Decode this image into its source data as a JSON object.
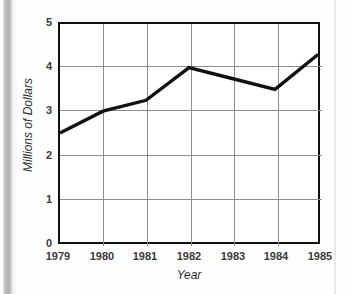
{
  "chart_data": {
    "type": "line",
    "title": "",
    "subtitle": "",
    "xlabel": "Year",
    "ylabel": "Millions of Dollars",
    "categories": [
      "1979",
      "1980",
      "1981",
      "1982",
      "1983",
      "1984",
      "1985"
    ],
    "x": [
      1979,
      1980,
      1981,
      1982,
      1983,
      1984,
      1985
    ],
    "values": [
      2.5,
      3.0,
      3.25,
      4.0,
      3.75,
      3.5,
      4.3
    ],
    "series": [
      {
        "name": "Sales",
        "values": [
          2.5,
          3.0,
          3.25,
          4.0,
          3.75,
          3.5,
          4.3
        ]
      }
    ],
    "xlim": [
      1979,
      1985
    ],
    "ylim": [
      0,
      5
    ],
    "ytick_labels": [
      "5",
      "4",
      "3",
      "2",
      "1",
      "0"
    ],
    "ytick_values": [
      5,
      4,
      3,
      2,
      1,
      0
    ],
    "xtick_labels": [
      "1979",
      "1980",
      "1981",
      "1982",
      "1983",
      "1984",
      "1985"
    ],
    "grid": true,
    "legend": false,
    "legend_position": "none",
    "line_color": "#111111",
    "grid_color": "#8d8d8d",
    "axis_color": "#111111",
    "background_color": "#ffffff"
  }
}
